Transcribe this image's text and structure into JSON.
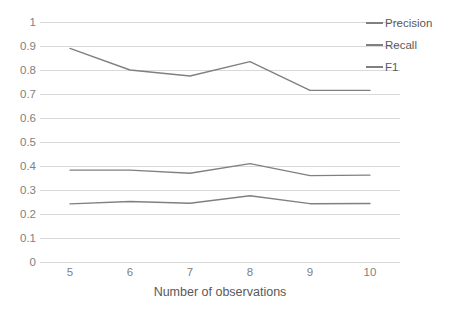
{
  "chart_data": {
    "type": "line",
    "title": "",
    "xlabel": "Number of observations",
    "ylabel": "",
    "categories": [
      "5",
      "6",
      "7",
      "8",
      "9",
      "10"
    ],
    "x": [
      5,
      6,
      7,
      8,
      9,
      10
    ],
    "xlim": [
      5,
      10
    ],
    "ylim": [
      0,
      1
    ],
    "y_ticks": [
      "1",
      "0.9",
      "0.8",
      "0.7",
      "0.6",
      "0.5",
      "0.4",
      "0.3",
      "0.2",
      "0.1",
      "0"
    ],
    "y_tick_values": [
      1,
      0.9,
      0.8,
      0.7,
      0.6,
      0.5,
      0.4,
      0.3,
      0.2,
      0.1,
      0
    ],
    "grid": "horizontal",
    "legend_position": "right",
    "series": [
      {
        "name": "Precision",
        "color": "#808080",
        "values": [
          0.89,
          0.8,
          0.775,
          0.835,
          0.715,
          0.715
        ]
      },
      {
        "name": "Recall",
        "color": "#808080",
        "values": [
          0.383,
          0.383,
          0.37,
          0.41,
          0.36,
          0.362
        ]
      },
      {
        "name": "F1",
        "color": "#808080",
        "values": [
          0.242,
          0.252,
          0.245,
          0.276,
          0.243,
          0.244
        ]
      }
    ]
  },
  "legend": {
    "items": [
      {
        "label": "Precision",
        "color": "#808080"
      },
      {
        "label": "Recall",
        "color": "#808080"
      },
      {
        "label": "F1",
        "color": "#808080"
      }
    ]
  },
  "colors": {
    "gridline": "#d9d9d9",
    "tick_text": "#7f7f7f",
    "title_text": "#595959",
    "background": "#ffffff"
  }
}
